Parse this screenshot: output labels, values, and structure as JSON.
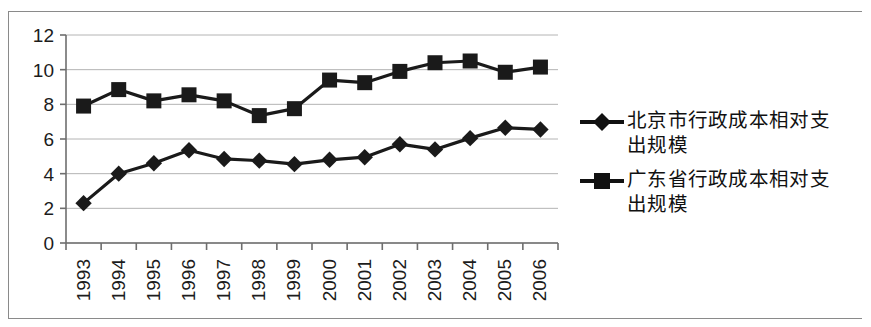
{
  "chart_data": {
    "type": "line",
    "title": "",
    "subtitle": "",
    "xlabel": "",
    "ylabel": "",
    "categories": [
      "1993",
      "1994",
      "1995",
      "1996",
      "1997",
      "1998",
      "1999",
      "2000",
      "2001",
      "2002",
      "2003",
      "2004",
      "2005",
      "2006"
    ],
    "ylim": [
      0,
      12
    ],
    "ytick_labels": [
      "0",
      "2",
      "4",
      "6",
      "8",
      "10",
      "12"
    ],
    "ytick_values": [
      0,
      2,
      4,
      6,
      8,
      10,
      12
    ],
    "grid": true,
    "grid_axis": "y",
    "legend_position": "right",
    "series": [
      {
        "name": "北京市行政成本相对支出规模",
        "marker": "diamond",
        "color": "#1a1a1a",
        "values": [
          2.3,
          4.0,
          4.6,
          5.35,
          4.85,
          4.75,
          4.55,
          4.8,
          4.95,
          5.7,
          5.4,
          6.05,
          6.65,
          6.55
        ]
      },
      {
        "name": "广东省行政成本相对支出规模",
        "marker": "square",
        "color": "#1a1a1a",
        "values": [
          7.9,
          8.85,
          8.2,
          8.55,
          8.2,
          7.35,
          7.75,
          9.4,
          9.25,
          9.9,
          10.4,
          10.5,
          9.85,
          10.15
        ]
      }
    ]
  },
  "legend": {
    "entries": [
      {
        "label": "北京市行政成本相对支出规模",
        "marker": "diamond-marker-icon"
      },
      {
        "label": "广东省行政成本相对支出规模",
        "marker": "square-marker-icon"
      }
    ]
  }
}
